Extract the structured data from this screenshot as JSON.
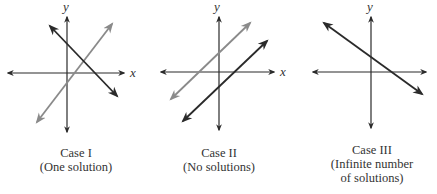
{
  "figure": {
    "colors": {
      "axis": "#2a2a2a",
      "line_dark": "#2a2a2a",
      "line_light": "#8a8a8a"
    },
    "panels": [
      {
        "id": "case-1",
        "x_axis_label": "x",
        "y_axis_label": "y",
        "caption": {
          "title": "Case I",
          "line1": "(One solution)"
        },
        "lines": [
          {
            "shade": "dark",
            "description": "negative slope line"
          },
          {
            "shade": "light",
            "description": "positive slope line intersecting the dark line"
          }
        ]
      },
      {
        "id": "case-2",
        "x_axis_label": "x",
        "y_axis_label": "y",
        "caption": {
          "title": "Case II",
          "line1": "(No solutions)"
        },
        "lines": [
          {
            "shade": "light",
            "description": "positive slope line"
          },
          {
            "shade": "dark",
            "description": "parallel positive slope line"
          }
        ]
      },
      {
        "id": "case-3",
        "x_axis_label": "",
        "y_axis_label": "y",
        "caption": {
          "title": "Case III",
          "line1": "(Infinite number",
          "line2": "of solutions)"
        },
        "lines": [
          {
            "shade": "dark",
            "description": "coincident negative slope lines"
          }
        ]
      }
    ]
  }
}
